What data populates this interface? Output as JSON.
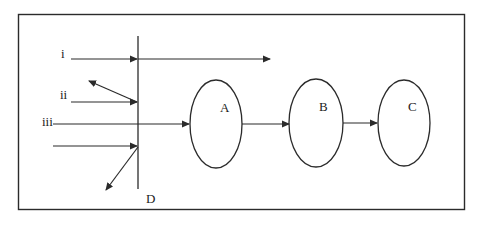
{
  "diagram": {
    "border": {
      "x": 18,
      "y": 14,
      "width": 447,
      "height": 196
    },
    "stroke_color": "#2b2b2b",
    "barrier": {
      "label": "D",
      "x": 138,
      "y1": 36,
      "y2": 189
    },
    "rays": [
      {
        "label": "i",
        "description": "passes through barrier",
        "from": [
          71,
          59
        ],
        "to": [
          270,
          59
        ]
      },
      {
        "label": "ii",
        "description": "reflected by barrier",
        "from": [
          71,
          102
        ],
        "to": [
          137,
          102
        ],
        "reflect_to": [
          89,
          81
        ]
      },
      {
        "label": "iii",
        "description": "passes through barrier into A",
        "from": [
          53,
          124
        ],
        "to": [
          190,
          124
        ]
      },
      {
        "label": "",
        "description": "reflected downward by barrier",
        "from": [
          53,
          146
        ],
        "to": [
          137,
          146
        ],
        "reflect_to": [
          106,
          190
        ]
      }
    ],
    "nodes": [
      {
        "id": "A",
        "label": "A",
        "cx": 216,
        "cy": 124,
        "rx": 26,
        "ry": 44
      },
      {
        "id": "B",
        "label": "B",
        "cx": 316,
        "cy": 123,
        "rx": 27,
        "ry": 44
      },
      {
        "id": "C",
        "label": "C",
        "cx": 404,
        "cy": 123,
        "rx": 26,
        "ry": 43
      }
    ],
    "edges": [
      {
        "from": "A",
        "to": "B"
      },
      {
        "from": "B",
        "to": "C"
      }
    ],
    "labels": {
      "ray_i": "i",
      "ray_ii": "ii",
      "ray_iii": "iii",
      "barrier": "D",
      "node_a": "A",
      "node_b": "B",
      "node_c": "C"
    }
  }
}
